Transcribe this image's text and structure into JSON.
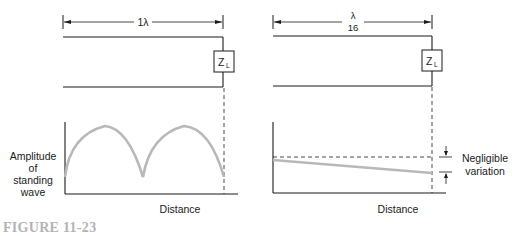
{
  "left_panel": {
    "length_label": "1λ",
    "load_label": "Z",
    "load_subscript": "L",
    "y_axis_label": [
      "Amplitude",
      "of",
      "standing",
      "wave"
    ],
    "x_axis_label": "Distance"
  },
  "right_panel": {
    "length_label_numerator": "λ",
    "length_label_denominator": "16",
    "load_label": "Z",
    "load_subscript": "L",
    "annotation": [
      "Negligible",
      "variation"
    ],
    "x_axis_label": "Distance"
  },
  "caption": "FIGURE 11-23",
  "colors": {
    "line": "#1a1a1a",
    "wave": "#b8b8b8",
    "caption": "#b3b3b3"
  }
}
